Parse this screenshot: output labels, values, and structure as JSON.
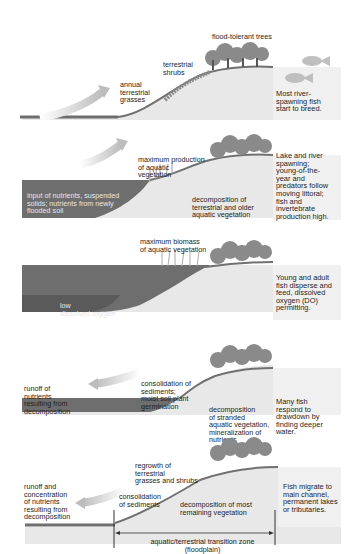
{
  "diagram": {
    "type": "floodplain flood-pulse stages",
    "colors": {
      "water": "#6e6e6e",
      "water_deep": "#5a5a5a",
      "land": "#e8e8e8",
      "tree": "#8a8a8a",
      "arrow": "#c8c8c8",
      "side_panel": "#f0f0f0"
    },
    "panels": [
      {
        "stage": 1,
        "labels": {
          "trees": "flood-tolerant trees",
          "shrubs": "terrestrial\nshrubs",
          "grasses": "annual\nterrestrial\ngrasses"
        },
        "side_text": "Most river-\nspawning fish\nstart to breed.",
        "arrow_direction": "right",
        "icons": [
          "fish-icon",
          "fish-icon"
        ]
      },
      {
        "stage": 2,
        "labels": {
          "production": "maximum production\nof aquatic\nvegetation",
          "input": "input of nutrients, suspended\nsolids; nutrients from newly\nflooded soil",
          "decomposition": "decomposition of\nterrestrial and older\naquatic vegetation"
        },
        "side_text": "Lake and river\nspawning;\nyoung-of-the-\nyear and\npredators follow\nmoving littoral;\nfish and\ninvertebrate\nproduction high.",
        "arrow_direction": "right"
      },
      {
        "stage": 3,
        "labels": {
          "biomass": "maximum biomass\nof aquatic vegetation",
          "oxygen": "low\ndissolved oxygen"
        },
        "side_text": "Young and adult\nfish disperse and\nfeed, dissolved\noxygen (DO)\npermitting."
      },
      {
        "stage": 4,
        "labels": {
          "runoff": "runoff of\nnutrients\nresulting from\ndecomposition",
          "consolidation": "consolidation of\nsediments;\nmoist soil plant\ngermination",
          "decomposition": "decomposition\nof stranded\naquatic vegetation,\nmineralization of\nnutrients"
        },
        "side_text": "Many fish\nrespond to\ndrawdown by\nfinding deeper\nwater.",
        "arrow_direction": "left"
      },
      {
        "stage": 5,
        "labels": {
          "runoff": "runoff and\nconcentration\nof nutrients\nresulting from\ndecomposition",
          "regrowth": "regrowth of\nterrestrial\ngrasses and shrubs",
          "consolidation": "consolidation\nof sediments",
          "decomposition": "decomposition of most\nremaining vegetation",
          "zone": "aquatic/terrestrial transition zone\n(floodplain)"
        },
        "side_text": "Fish migrate to\nmain channel,\npermanent lakes\nor tributaries.",
        "arrow_direction": "left"
      }
    ]
  }
}
